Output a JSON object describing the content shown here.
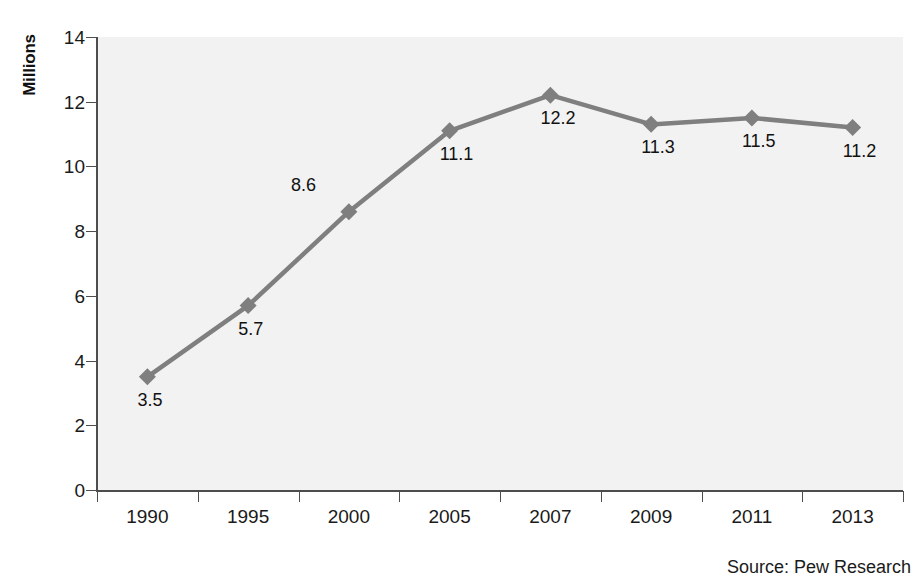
{
  "chart_data": {
    "type": "line",
    "title": "",
    "subtitle": "",
    "xlabel": "",
    "ylabel": "Millions",
    "categories": [
      "1990",
      "1995",
      "2000",
      "2005",
      "2007",
      "2009",
      "2011",
      "2013"
    ],
    "values": [
      3.5,
      5.7,
      8.6,
      11.1,
      12.2,
      11.3,
      11.5,
      11.2
    ],
    "point_labels": [
      "3.5",
      "5.7",
      "8.6",
      "11.1",
      "12.2",
      "11.3",
      "11.5",
      "11.2"
    ],
    "ylim": [
      0,
      14
    ],
    "y_ticks": [
      0,
      2,
      4,
      6,
      8,
      10,
      12,
      14
    ],
    "y_tick_labels": [
      "0",
      "2",
      "4",
      "6",
      "8",
      "10",
      "12",
      "14"
    ],
    "grid": false,
    "legend": "none",
    "series_color": "#7f7f7f",
    "marker": "diamond",
    "plot_background": "#f2f2f2",
    "axis_color": "#4d4d4d",
    "annotations": [
      "Source: Pew Research"
    ]
  },
  "source": {
    "text": "Source: Pew Research"
  },
  "axis": {
    "y_title": "Millions"
  }
}
